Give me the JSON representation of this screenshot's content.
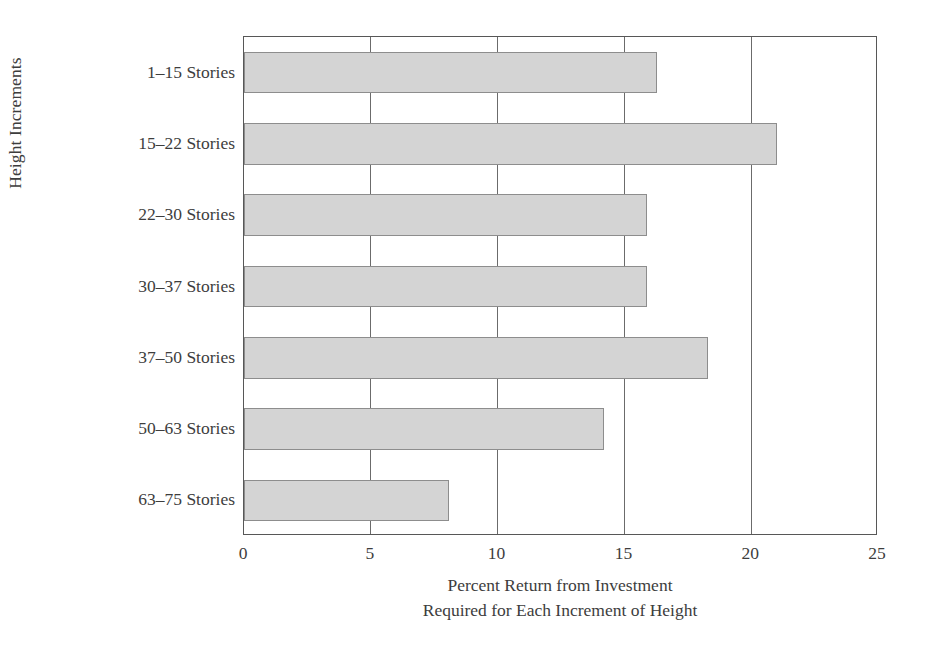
{
  "chart_data": {
    "type": "bar",
    "orientation": "horizontal",
    "title": "",
    "xlabel_line1": "Percent Return from Investment",
    "xlabel_line2": "Required for Each Increment of Height",
    "ylabel": "Height Increments",
    "categories": [
      "1–15 Stories",
      "15–22 Stories",
      "22–30 Stories",
      "30–37 Stories",
      "37–50 Stories",
      "50–63 Stories",
      "63–75 Stories"
    ],
    "values": [
      16.3,
      21.0,
      15.9,
      15.9,
      18.3,
      14.2,
      8.1
    ],
    "xlim": [
      0,
      25
    ],
    "ylim": [
      0,
      7
    ],
    "xticks": [
      0,
      5,
      10,
      15,
      20,
      25
    ],
    "xtick_labels": [
      "0",
      "5",
      "10",
      "15",
      "20",
      "25"
    ],
    "grid": "vertical-only",
    "legend": "none",
    "bar_fill_color": "#d4d4d4",
    "bar_border_color": "#8d8d8d",
    "axis_color": "#575757",
    "gridline_color": "#6b6b6b",
    "background_color": "#ffffff",
    "text_color": "#3d3d3d"
  }
}
